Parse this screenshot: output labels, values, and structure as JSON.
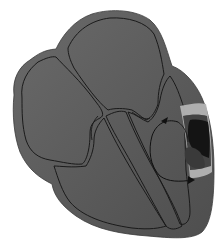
{
  "diagram": {
    "chambers": [
      {
        "name": "right-atrium",
        "position": "upper-left"
      },
      {
        "name": "left-atrium",
        "position": "upper-center"
      },
      {
        "name": "right-ventricle",
        "position": "lower-center"
      },
      {
        "name": "left-ventricle",
        "position": "right"
      }
    ],
    "features": [
      {
        "name": "interventricular-septum"
      },
      {
        "name": "scar-region",
        "color": "#1c1c1c"
      },
      {
        "name": "border-zone",
        "color": "#b0b0b0"
      },
      {
        "name": "reentry-loop-arrows",
        "count": 2
      }
    ],
    "colors": {
      "wall": "#555555",
      "chamber_light": "#f2f2f2",
      "chamber_dark": "#5a5a5a",
      "outline": "#1a1a1a",
      "background": "#ffffff"
    }
  }
}
